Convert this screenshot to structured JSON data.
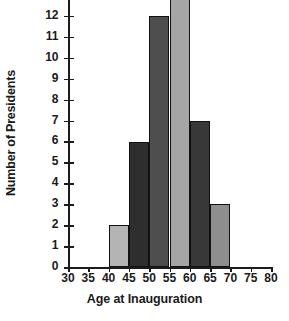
{
  "chart_data": {
    "type": "bar",
    "title": "",
    "subtitle": "",
    "xlabel": "Age at Inauguration",
    "ylabel": "Number of Presidents",
    "xlim": [
      30,
      80
    ],
    "ylim": [
      0,
      13
    ],
    "grid": false,
    "legend": null,
    "note": "Histogram of US presidents' age at inauguration. Bin width 5 years. The tallest bar (55-60) is clipped by the top edge of the screenshot; its top and the topmost y tick label (13) are cut off.",
    "bin_width": 5,
    "xticks": [
      "30",
      "35",
      "40",
      "45",
      "50",
      "55",
      "60",
      "65",
      "70",
      "75",
      "80"
    ],
    "xtick_values": [
      30,
      35,
      40,
      45,
      50,
      55,
      60,
      65,
      70,
      75,
      80
    ],
    "yticks": [
      "0",
      "1",
      "2",
      "3",
      "4",
      "5",
      "6",
      "7",
      "8",
      "9",
      "10",
      "11",
      "12"
    ],
    "ytick_values": [
      0,
      1,
      2,
      3,
      4,
      5,
      6,
      7,
      8,
      9,
      10,
      11,
      12
    ],
    "categories": [
      "40-45",
      "45-50",
      "50-55",
      "55-60",
      "60-65",
      "65-70"
    ],
    "bin_starts": [
      40,
      45,
      50,
      55,
      60,
      65
    ],
    "values": [
      2,
      6,
      12,
      15,
      7,
      3
    ],
    "bar_colors": [
      "#b4b4b4",
      "#2e2e2e",
      "#4e4e4e",
      "#a5a5a5",
      "#383838",
      "#8e8e8e"
    ],
    "bar_edge_color": "#111111",
    "axis_color": "#1c1c1c",
    "background_color": "#ffffff"
  }
}
